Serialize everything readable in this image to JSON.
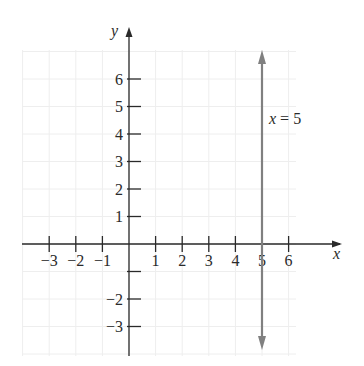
{
  "chart_data": {
    "type": "line",
    "title": "",
    "xlabel": "x",
    "ylabel": "y",
    "xlim": [
      -4,
      7
    ],
    "ylim": [
      -4,
      7
    ],
    "grid": true,
    "x_ticks": [
      -3,
      -2,
      -1,
      1,
      2,
      3,
      4,
      5,
      6
    ],
    "y_ticks": [
      -3,
      -2,
      -1,
      1,
      2,
      3,
      4,
      5,
      6
    ],
    "x_tick_labels": [
      "−3",
      "−2",
      "−1",
      "1",
      "2",
      "3",
      "4",
      "5",
      "6"
    ],
    "y_tick_labels": [
      "−3",
      "−2",
      "",
      "1",
      "2",
      "3",
      "4",
      "5",
      "6"
    ],
    "series": [
      {
        "name": "x = 5",
        "kind": "vertical-line",
        "x": [
          5,
          5
        ],
        "y": [
          -4,
          7
        ],
        "arrows": "both",
        "color": "#808080"
      }
    ],
    "annotations": [
      {
        "text": "x = 5",
        "x": 5.3,
        "y": 3.6
      }
    ],
    "colors": {
      "axis": "#2a2a2a",
      "grid": "#eeeeee",
      "line": "#808080"
    }
  },
  "labels": {
    "x_axis": "x",
    "y_axis": "y",
    "line_label_var": "x",
    "line_label_rest": " = 5"
  }
}
